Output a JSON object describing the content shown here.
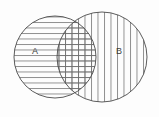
{
  "figure": {
    "type": "venn-diagram",
    "title": "",
    "background_color": "#fdfdfd",
    "stroke_color": "#4a4a4a",
    "hatch_color": "#6e6e6e",
    "label_color": "#3c3c3c",
    "width": 159,
    "height": 117
  },
  "sets": [
    {
      "id": "A",
      "label": "A",
      "label_x": 35,
      "label_y": 52,
      "hatch": "horizontal",
      "hatch_spacing": 5.5,
      "center_x": 55,
      "center_y": 57,
      "radius": 41
    },
    {
      "id": "B",
      "label": "B",
      "label_x": 119,
      "label_y": 52,
      "hatch": "vertical",
      "hatch_spacing": 6.5,
      "center_x": 102,
      "center_y": 57,
      "radius": 45
    }
  ],
  "intersection": {
    "id": "A-and-B",
    "label": "",
    "hatch": "cross",
    "top_vertex_x": 78,
    "top_vertex_y": 18,
    "bottom_vertex_x": 78,
    "bottom_vertex_y": 98
  }
}
